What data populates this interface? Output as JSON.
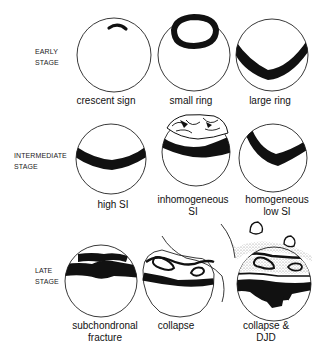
{
  "stages": [
    {
      "label_line1": "EARLY",
      "label_line2": "STAGE",
      "panels": [
        {
          "caption_line1": "crescent sign",
          "caption_line2": ""
        },
        {
          "caption_line1": "small ring",
          "caption_line2": ""
        },
        {
          "caption_line1": "large ring",
          "caption_line2": ""
        }
      ]
    },
    {
      "label_line1": "INTERMEDIATE",
      "label_line2": "STAGE",
      "panels": [
        {
          "caption_line1": "high SI",
          "caption_line2": ""
        },
        {
          "caption_line1": "inhomogeneous",
          "caption_line2": "SI"
        },
        {
          "caption_line1": "homogeneous",
          "caption_line2": "low SI"
        }
      ]
    },
    {
      "label_line1": "LATE",
      "label_line2": "STAGE",
      "panels": [
        {
          "caption_line1": "subchondronal",
          "caption_line2": "fracture"
        },
        {
          "caption_line1": "collapse",
          "caption_line2": ""
        },
        {
          "caption_line1": "collapse &",
          "caption_line2": "DJD"
        }
      ]
    }
  ],
  "colors": {
    "ink": "#111111",
    "background": "#ffffff",
    "stipple": "#9a9a9a"
  }
}
